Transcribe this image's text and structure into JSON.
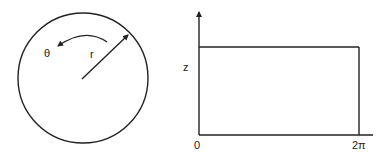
{
  "left_panel": {
    "shape": "circle",
    "angle_label": "θ",
    "radius_label": "r",
    "stroke_color": "#222222"
  },
  "right_panel": {
    "y_axis_label": "z",
    "x_axis_start_label": "0",
    "x_axis_end_label": "2π",
    "stroke_color": "#222222"
  }
}
